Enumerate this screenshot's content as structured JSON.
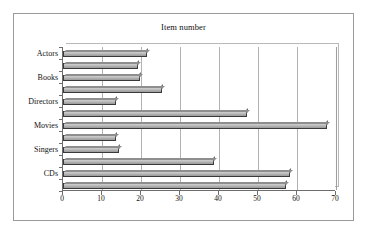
{
  "chart_data": {
    "type": "bar",
    "orientation": "horizontal",
    "title": "Item number",
    "xlabel": "",
    "ylabel": "",
    "xlim": [
      0,
      70
    ],
    "xticks": [
      0,
      10,
      20,
      30,
      40,
      50,
      60,
      70
    ],
    "grid": true,
    "legend": "none",
    "categories": [
      "CDs",
      "Singers",
      "Movies",
      "Directors",
      "Books",
      "Actors"
    ],
    "series": [
      {
        "name": "Series 1",
        "values": [
          57.3,
          38.7,
          67.7,
          47.2,
          25.4,
          19.2
        ]
      },
      {
        "name": "Series 2",
        "values": [
          58.1,
          14.4,
          13.7,
          13.5,
          19.8,
          21.6
        ]
      }
    ],
    "bars_top_to_bottom": [
      {
        "category": "Actors",
        "series": "Series 2",
        "value": 21.6
      },
      {
        "category": "Actors",
        "series": "Series 1",
        "value": 19.2
      },
      {
        "category": "Books",
        "series": "Series 2",
        "value": 19.8
      },
      {
        "category": "Books",
        "series": "Series 1",
        "value": 25.4
      },
      {
        "category": "Directors",
        "series": "Series 2",
        "value": 13.5
      },
      {
        "category": "Directors",
        "series": "Series 1",
        "value": 47.2
      },
      {
        "category": "Movies",
        "series": "Series 2",
        "value": 67.7
      },
      {
        "category": "Movies",
        "series": "Series 1",
        "value": 13.7
      },
      {
        "category": "Singers",
        "series": "Series 2",
        "value": 14.4
      },
      {
        "category": "Singers",
        "series": "Series 1",
        "value": 38.7
      },
      {
        "category": "CDs",
        "series": "Series 2",
        "value": 58.1
      },
      {
        "category": "CDs",
        "series": "Series 1",
        "value": 57.3
      }
    ],
    "colors": {
      "bar_fill": "#bdbdbd",
      "bar_outline": "#3a3a3a",
      "gridline": "#b2b2b2",
      "axis": "#6d6d6d",
      "frame": "#9a9a9a",
      "background": "#ffffff",
      "text": "#111111"
    }
  }
}
